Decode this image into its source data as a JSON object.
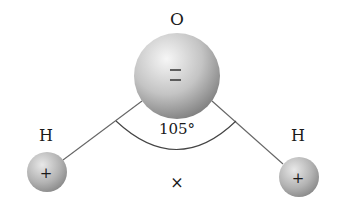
{
  "diagram": {
    "oxygen": {
      "label": "O",
      "charge": "=",
      "center": [
        177,
        76
      ],
      "radius": 43
    },
    "hydrogen_left": {
      "label": "H",
      "charge": "+",
      "center": [
        47,
        172
      ],
      "radius": 20
    },
    "hydrogen_right": {
      "label": "H",
      "charge": "+",
      "center": [
        299,
        177
      ],
      "radius": 20
    },
    "bond_angle": {
      "label": "105°"
    },
    "center_mark": {
      "label": "×"
    },
    "colors": {
      "line": "#555555",
      "text": "#1a1a1a",
      "sphere_light": "#f4f4f4",
      "sphere_dark": "#8a8a8a"
    }
  }
}
